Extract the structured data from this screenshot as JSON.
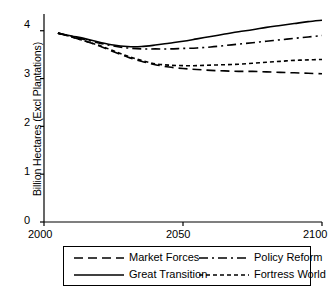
{
  "chart_data": {
    "type": "line",
    "title": "",
    "xlabel": "",
    "ylabel": "Billion Hectares (Excl Plantations)",
    "xlim": [
      2000,
      2100
    ],
    "ylim": [
      0,
      4.35
    ],
    "xticks": [
      2000,
      2050,
      2100
    ],
    "xtick_labels": [
      "2000",
      "2050",
      "2100"
    ],
    "yticks": [
      0,
      1,
      2,
      3,
      4
    ],
    "ytick_labels": [
      "0",
      "1",
      "2",
      "3",
      "4"
    ],
    "grid": false,
    "legend_position": "below-axes",
    "x": [
      2005,
      2010,
      2015,
      2020,
      2025,
      2030,
      2035,
      2040,
      2045,
      2050,
      2055,
      2060,
      2065,
      2070,
      2075,
      2080,
      2085,
      2090,
      2095,
      2100
    ],
    "series": [
      {
        "name": "Market Forces",
        "dash": "long-dash",
        "values": [
          3.95,
          3.87,
          3.78,
          3.68,
          3.56,
          3.45,
          3.36,
          3.29,
          3.24,
          3.21,
          3.19,
          3.17,
          3.16,
          3.15,
          3.15,
          3.14,
          3.13,
          3.12,
          3.11,
          3.1
        ]
      },
      {
        "name": "Great Transition",
        "dash": "solid",
        "values": [
          3.95,
          3.89,
          3.83,
          3.76,
          3.7,
          3.67,
          3.67,
          3.7,
          3.74,
          3.78,
          3.83,
          3.88,
          3.93,
          3.98,
          4.02,
          4.07,
          4.11,
          4.15,
          4.19,
          4.22
        ]
      },
      {
        "name": "Policy Reform",
        "dash": "dash-dot",
        "values": [
          3.95,
          3.88,
          3.81,
          3.74,
          3.68,
          3.64,
          3.62,
          3.62,
          3.62,
          3.63,
          3.64,
          3.66,
          3.69,
          3.72,
          3.75,
          3.78,
          3.81,
          3.84,
          3.87,
          3.9
        ]
      },
      {
        "name": "Fortress World",
        "dash": "short-dash",
        "values": [
          3.95,
          3.87,
          3.78,
          3.69,
          3.58,
          3.47,
          3.38,
          3.31,
          3.28,
          3.27,
          3.27,
          3.28,
          3.29,
          3.3,
          3.32,
          3.34,
          3.36,
          3.38,
          3.39,
          3.4
        ]
      }
    ]
  },
  "legend": {
    "items": [
      {
        "label": "Market Forces",
        "dash": "long-dash"
      },
      {
        "label": "Policy Reform",
        "dash": "dash-dot"
      },
      {
        "label": "Great Transition",
        "dash": "solid"
      },
      {
        "label": "Fortress World",
        "dash": "short-dash"
      }
    ]
  },
  "axes": {
    "ylabel": "Billion Hectares (Excl Plantations)",
    "ytick_0": "0",
    "ytick_1": "1",
    "ytick_2": "2",
    "ytick_3": "3",
    "ytick_4": "4",
    "xtick_0": "2000",
    "xtick_1": "2050",
    "xtick_2": "2100"
  }
}
